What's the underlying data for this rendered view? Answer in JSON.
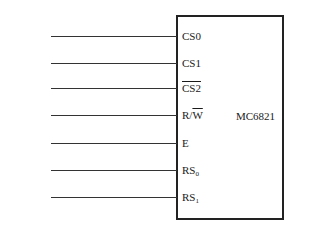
{
  "chip": {
    "name": "MC6821"
  },
  "connections": [
    {
      "signal": "VMA",
      "pin": "CS0",
      "signal_overline": "",
      "pin_overline": ""
    },
    {
      "signal": "A",
      "signal_sub": "14",
      "pin": "CS1"
    },
    {
      "signal": "A",
      "signal_sub": "15",
      "pin": "CS2",
      "pin_overbar": true
    },
    {
      "signal": "R/",
      "signal_bar_part": "W",
      "pin": "R/",
      "pin_bar_part": "W"
    },
    {
      "signal": "φ",
      "signal_sub": "2",
      "signal_suffix": " TTL",
      "pin": "E"
    },
    {
      "signal": "A",
      "signal_sub": "0",
      "pin": "RS",
      "pin_sub": "0"
    },
    {
      "signal": "A",
      "signal_sub": "1",
      "pin": "RS",
      "pin_sub": "1"
    }
  ]
}
